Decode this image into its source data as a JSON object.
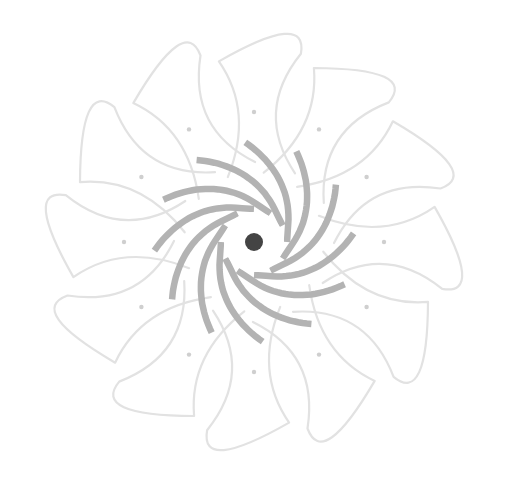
{
  "figure": {
    "description": "Spiral flower motif",
    "width": 506,
    "height": 491,
    "background": "#ffffff"
  },
  "motif": {
    "center": {
      "x": 254,
      "y": 242
    },
    "center_dot": {
      "radius": 9,
      "color": "#444444"
    },
    "inner_clear_radius": 33,
    "arcs": {
      "count": 12,
      "inner_radius": 33,
      "outer_radius": 100,
      "sweep_degrees": 95,
      "start_angle_degrees": 0,
      "stroke_width": 6.5,
      "color": "#b3b3b3"
    },
    "petals": {
      "count": 12,
      "start_angle_degrees": -90,
      "base_radius": 70,
      "cross_radius": 130,
      "tip_radius": 238,
      "width": 50,
      "twist_degrees": 22,
      "stroke_width": 2.2,
      "color": "#e2e2e2",
      "cross_color": "#cfcfcf"
    }
  }
}
